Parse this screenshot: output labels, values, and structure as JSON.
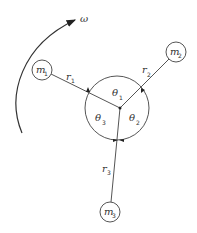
{
  "diagram": {
    "title": "",
    "rotation": {
      "label": "ω"
    },
    "hub": {
      "cx": 117,
      "cy": 108,
      "r": 32
    },
    "center": {
      "x": 120,
      "y": 108
    },
    "masses": [
      {
        "id": "m1",
        "base": "m",
        "sub": "1",
        "cx": 42,
        "cy": 70,
        "r": 10,
        "arm_label_base": "r",
        "arm_label_sub": "1"
      },
      {
        "id": "m2",
        "base": "m",
        "sub": "2",
        "cx": 176,
        "cy": 52,
        "r": 10,
        "arm_label_base": "r",
        "arm_label_sub": "2"
      },
      {
        "id": "m3",
        "base": "m",
        "sub": "3",
        "cx": 110,
        "cy": 212,
        "r": 10,
        "arm_label_base": "r",
        "arm_label_sub": "3"
      }
    ],
    "angles": [
      {
        "base": "θ",
        "sub": "1"
      },
      {
        "base": "θ",
        "sub": "2"
      },
      {
        "base": "θ",
        "sub": "3"
      }
    ]
  },
  "colors": {
    "stroke": "#444444",
    "text": "#333333",
    "background": "#ffffff"
  }
}
